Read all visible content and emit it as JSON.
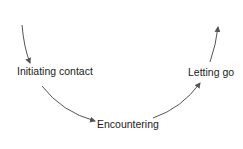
{
  "diagram": {
    "type": "cycle-flow",
    "nodes": [
      {
        "id": "initiating",
        "label": "Initiating contact"
      },
      {
        "id": "encountering",
        "label": "Encountering"
      },
      {
        "id": "letting_go",
        "label": "Letting go"
      }
    ],
    "edges": [
      {
        "from": "entry",
        "to": "initiating"
      },
      {
        "from": "initiating",
        "to": "encountering"
      },
      {
        "from": "encountering",
        "to": "letting_go"
      },
      {
        "from": "letting_go",
        "to": "exit"
      }
    ],
    "colors": {
      "arrow": "#555555",
      "text": "#222222",
      "background": "#ffffff"
    }
  }
}
